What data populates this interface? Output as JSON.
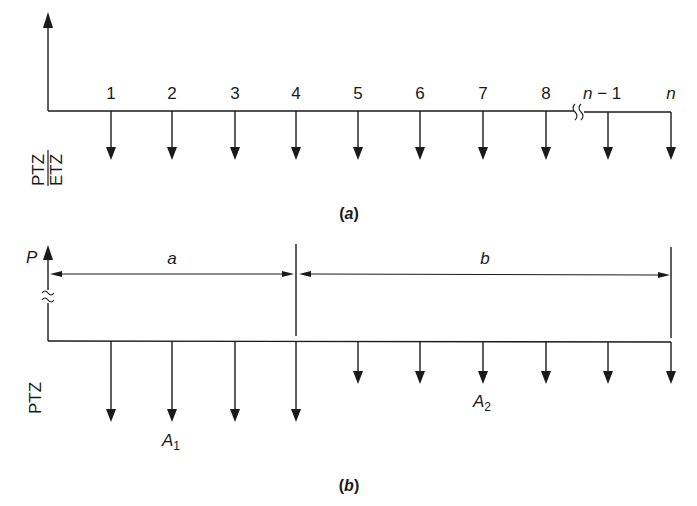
{
  "panel_a": {
    "caption_open": "(",
    "caption_letter": "a",
    "caption_close": ")",
    "side_label_top": "PTZ",
    "side_label_bottom": "ETZ",
    "period_labels": [
      "1",
      "2",
      "3",
      "4",
      "5",
      "6",
      "7",
      "8",
      "n − 1",
      "n"
    ],
    "period_label_n_minus_1_var": "n",
    "period_label_n_minus_1_rest": " − 1",
    "period_label_n": "n"
  },
  "panel_b": {
    "caption_open": "(",
    "caption_letter": "b",
    "caption_close": ")",
    "side_label": "PTZ",
    "present_value_label": "P",
    "span_a_label": "a",
    "span_b_label": "b",
    "annuity_1_label": "A",
    "annuity_1_sub": "1",
    "annuity_2_label": "A",
    "annuity_2_sub": "2"
  },
  "colors": {
    "line": "#1a1a1a",
    "background": "#ffffff"
  }
}
